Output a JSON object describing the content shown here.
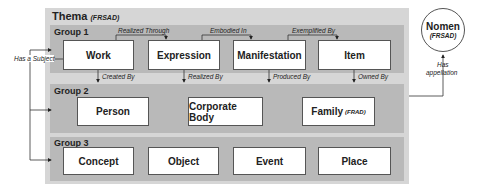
{
  "thema": {
    "title": "Thema",
    "subtitle": "(FRSAD)"
  },
  "groups": [
    {
      "label": "Group 1",
      "entities": [
        {
          "label": "Work"
        },
        {
          "label": "Expression"
        },
        {
          "label": "Manifestation"
        },
        {
          "label": "Item"
        }
      ]
    },
    {
      "label": "Group 2",
      "entities": [
        {
          "label": "Person"
        },
        {
          "label": "Corporate Body"
        },
        {
          "label": "Family",
          "note": "(FRAD)"
        }
      ]
    },
    {
      "label": "Group 3",
      "entities": [
        {
          "label": "Concept"
        },
        {
          "label": "Object"
        },
        {
          "label": "Event"
        },
        {
          "label": "Place"
        }
      ]
    }
  ],
  "relationships": {
    "realized_through": "Realized Through",
    "embodied_in": "Embodied In",
    "exemplified_by": "Exemplified By",
    "created_by": "Created By",
    "realized_by": "Realized By",
    "produced_by": "Produced By",
    "owned_by": "Owned By",
    "has_a_subject": "Has a Subject",
    "has_appellation_1": "Has",
    "has_appellation_2": "appellation"
  },
  "nomen": {
    "title": "Nomen",
    "subtitle": "(FRSAD)"
  }
}
